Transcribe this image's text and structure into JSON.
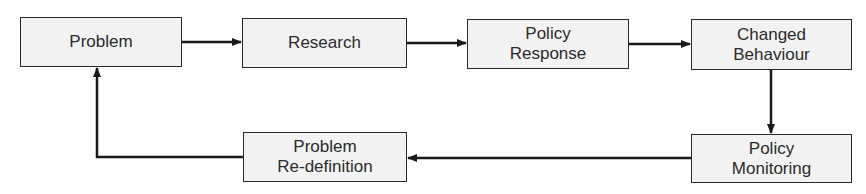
{
  "diagram": {
    "type": "flowchart-cycle",
    "nodes": [
      {
        "id": "problem",
        "lines": [
          "Problem"
        ]
      },
      {
        "id": "research",
        "lines": [
          "Research"
        ]
      },
      {
        "id": "policy_response",
        "lines": [
          "Policy",
          "Response"
        ]
      },
      {
        "id": "changed_behaviour",
        "lines": [
          "Changed",
          "Behaviour"
        ]
      },
      {
        "id": "policy_monitoring",
        "lines": [
          "Policy",
          "Monitoring"
        ]
      },
      {
        "id": "problem_redefinition",
        "lines": [
          "Problem",
          "Re-definition"
        ]
      }
    ],
    "edges": [
      {
        "from": "problem",
        "to": "research"
      },
      {
        "from": "research",
        "to": "policy_response"
      },
      {
        "from": "policy_response",
        "to": "changed_behaviour"
      },
      {
        "from": "changed_behaviour",
        "to": "policy_monitoring"
      },
      {
        "from": "policy_monitoring",
        "to": "problem_redefinition"
      },
      {
        "from": "problem_redefinition",
        "to": "problem"
      }
    ],
    "colors": {
      "box_fill": "#f2f2f2",
      "stroke": "#2a2a2a",
      "text": "#2b2b2b"
    }
  }
}
